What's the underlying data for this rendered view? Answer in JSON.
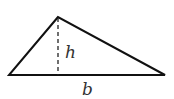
{
  "diagram": {
    "shape": "triangle",
    "labels": {
      "height": "h",
      "base": "b"
    },
    "colors": {
      "stroke": "#111111",
      "text": "#333333"
    }
  }
}
